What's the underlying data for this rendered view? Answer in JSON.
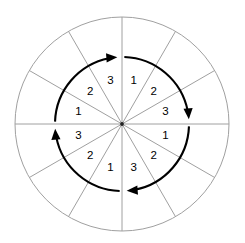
{
  "figure": {
    "geometry": {
      "width": 245,
      "height": 243,
      "center_x": 122,
      "center_y": 124,
      "outer_radius": 107,
      "arc_radius": 67,
      "sector_count": 12,
      "sector_angle_deg": 30,
      "label_radius": 45
    },
    "colors": {
      "background": "#ffffff",
      "outline": "#a0a0a0",
      "spoke": "#a0a0a0",
      "arrow": "#000000",
      "label": "#000000",
      "center_dot": "#222222"
    },
    "sectors": [
      {
        "label": "1",
        "angle_deg": -75,
        "quadrant": "upper-right"
      },
      {
        "label": "2",
        "angle_deg": -45,
        "quadrant": "upper-right"
      },
      {
        "label": "3",
        "angle_deg": -15,
        "quadrant": "upper-right"
      },
      {
        "label": "1",
        "angle_deg": 15,
        "quadrant": "lower-right"
      },
      {
        "label": "2",
        "angle_deg": 45,
        "quadrant": "lower-right"
      },
      {
        "label": "3",
        "angle_deg": 75,
        "quadrant": "lower-right"
      },
      {
        "label": "1",
        "angle_deg": 105,
        "quadrant": "lower-left"
      },
      {
        "label": "2",
        "angle_deg": 135,
        "quadrant": "lower-left"
      },
      {
        "label": "3",
        "angle_deg": 165,
        "quadrant": "lower-left"
      },
      {
        "label": "1",
        "angle_deg": 195,
        "quadrant": "upper-left"
      },
      {
        "label": "2",
        "angle_deg": 225,
        "quadrant": "upper-left"
      },
      {
        "label": "3",
        "angle_deg": 255,
        "quadrant": "upper-left"
      }
    ],
    "arrows": [
      {
        "name": "arrow-upper-right",
        "start_deg": -88,
        "end_deg": -4,
        "direction": "clockwise"
      },
      {
        "name": "arrow-lower-right",
        "start_deg": 2,
        "end_deg": 86,
        "direction": "clockwise"
      },
      {
        "name": "arrow-lower-left",
        "start_deg": 92,
        "end_deg": 176,
        "direction": "clockwise"
      },
      {
        "name": "arrow-upper-left",
        "start_deg": 182,
        "end_deg": 266,
        "direction": "clockwise"
      }
    ],
    "spoke_angles_deg": [
      0,
      30,
      60,
      90,
      120,
      150,
      180,
      210,
      240,
      270,
      300,
      330
    ]
  }
}
